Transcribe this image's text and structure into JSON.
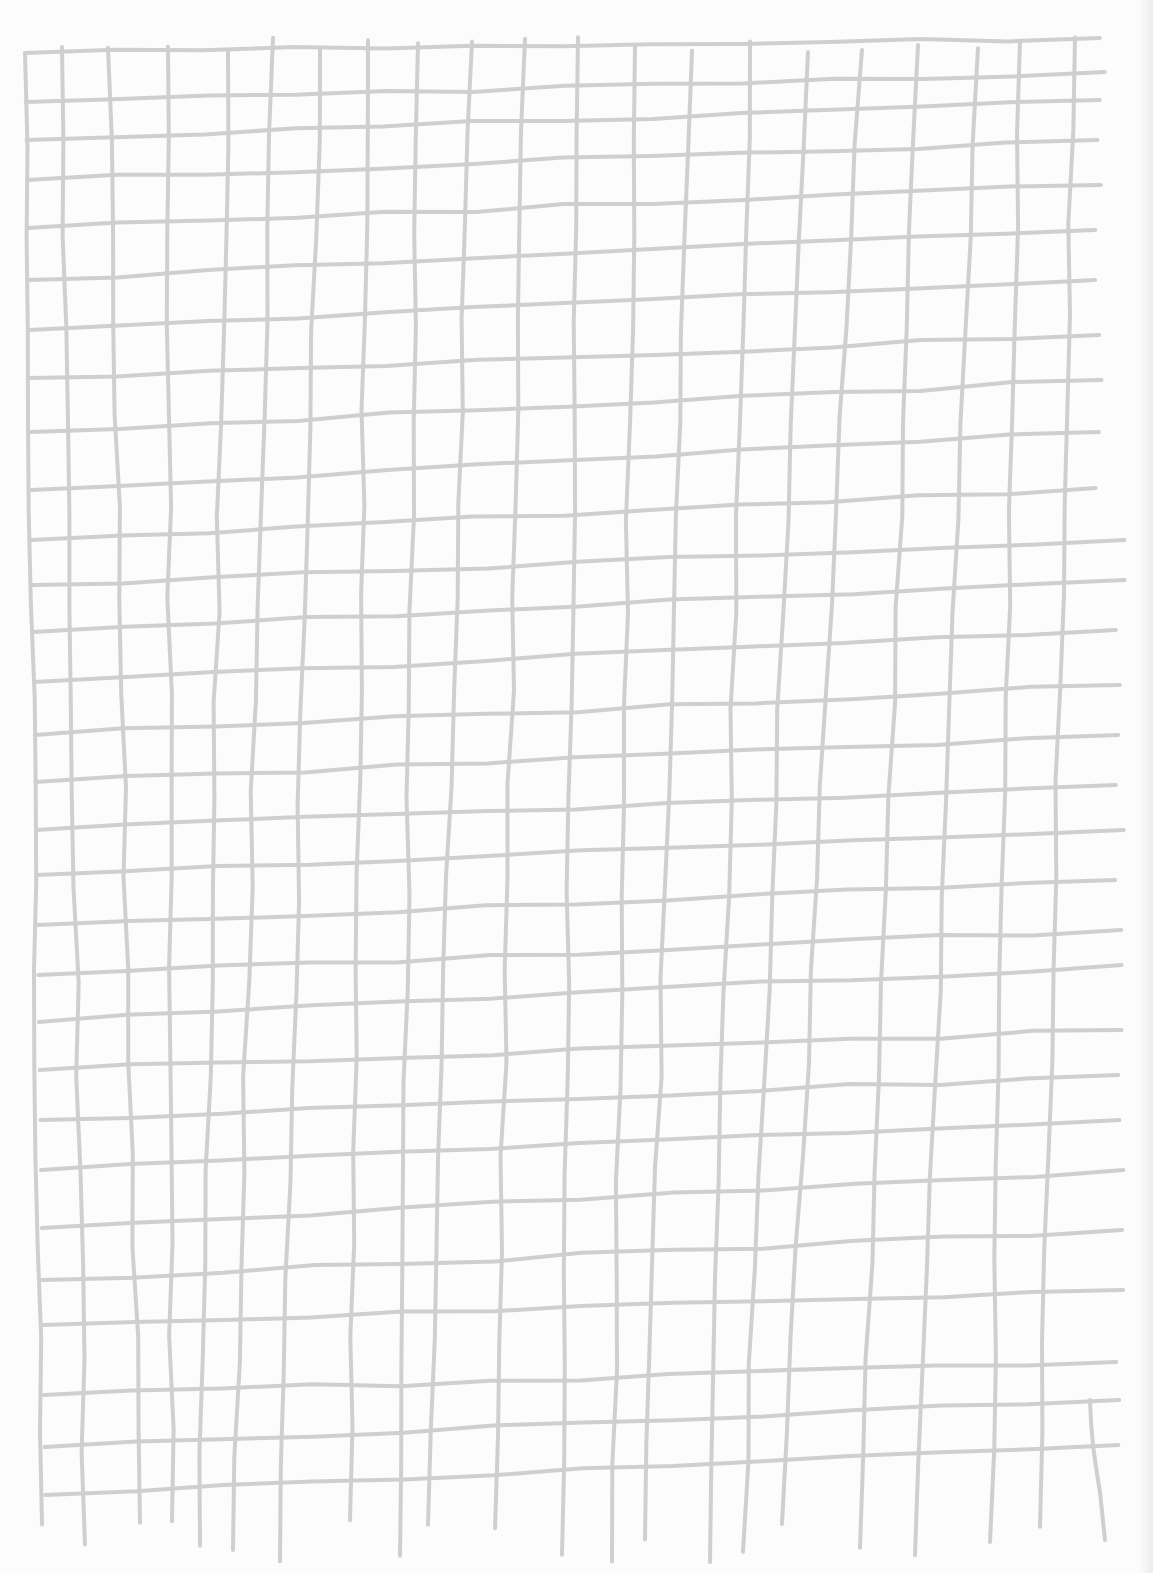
{
  "image": {
    "description": "Hand-drawn pencil grid on white paper",
    "width": 1153,
    "height": 1573
  },
  "colors": {
    "paper": "#fcfcfc",
    "line": "#cfcfcf",
    "edge_shadow": "#ececec"
  },
  "grid": {
    "stroke_width": 4,
    "vertical_lines_x_top": [
      25,
      62,
      108,
      168,
      228,
      273,
      320,
      368,
      418,
      472,
      525,
      578,
      635,
      692,
      750,
      808,
      862,
      918,
      978,
      1020,
      1075
    ],
    "vertical_lines_x_bottom": [
      42,
      85,
      140,
      172,
      200,
      233,
      280,
      350,
      400,
      428,
      495,
      562,
      612,
      645,
      710,
      743,
      782,
      860,
      915,
      990,
      1040,
      1105
    ],
    "horizontal_lines_y_left": [
      53,
      102,
      140,
      180,
      228,
      280,
      330,
      378,
      432,
      490,
      540,
      585,
      632,
      682,
      735,
      782,
      830,
      875,
      925,
      975,
      1022,
      1070,
      1120,
      1170,
      1228,
      1280,
      1325,
      1395,
      1447,
      1495
    ],
    "horizontal_lines_y_right": [
      38,
      72,
      100,
      140,
      185,
      230,
      280,
      335,
      380,
      432,
      488,
      540,
      580,
      630,
      685,
      735,
      785,
      830,
      880,
      930,
      965,
      1030,
      1075,
      1120,
      1170,
      1230,
      1290,
      1362,
      1400,
      1445
    ]
  }
}
